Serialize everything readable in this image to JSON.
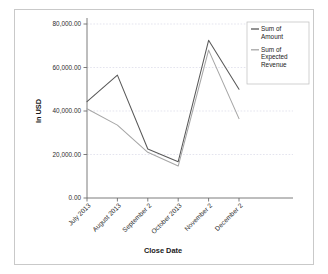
{
  "chart_data": {
    "type": "line",
    "title": "",
    "xlabel": "Close Date",
    "ylabel": "In USD",
    "categories": [
      "July 2013",
      "August 2013",
      "September 2",
      "October 2013",
      "November 2",
      "December 2"
    ],
    "ytick_labels": [
      "0.00",
      "20,000.00",
      "40,000.00",
      "60,000.00",
      "80,000.00"
    ],
    "ytick_values": [
      0,
      20000,
      40000,
      60000,
      80000
    ],
    "ylim": [
      0,
      80000
    ],
    "grid": true,
    "legend_position": "top-right",
    "series": [
      {
        "name": "Sum of Amount",
        "color": "#595959",
        "values": [
          44300,
          56500,
          22500,
          16700,
          72500,
          50000
        ]
      },
      {
        "name": "Sum of Expected Revenue",
        "color": "#a6a6a6",
        "values": [
          41000,
          33500,
          21000,
          14700,
          68000,
          36500
        ]
      }
    ]
  },
  "legend": {
    "items": [
      {
        "label_line1": "Sum of",
        "label_line2": "Amount",
        "label_line3": ""
      },
      {
        "label_line1": "Sum of",
        "label_line2": "Expected",
        "label_line3": "Revenue"
      }
    ]
  },
  "colors": {
    "frame_border": "#c9c9c9",
    "axis": "#6e6e6e",
    "grid": "#d9d9e6",
    "series_amount": "#595959",
    "series_expected": "#a6a6a6",
    "background": "#ffffff"
  }
}
